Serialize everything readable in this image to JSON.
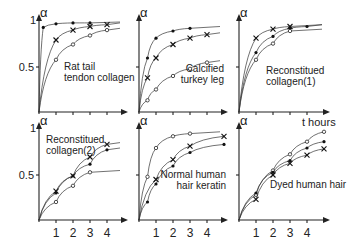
{
  "chart_data": [
    {
      "type": "line",
      "title": "Rat tail tendon collagen",
      "xlabel": "",
      "ylabel": "α",
      "ylim": [
        0,
        1
      ],
      "yticks": [
        "0.5",
        "1"
      ],
      "series": [
        {
          "name": "dot",
          "marker": "dot",
          "x": [
            0.25,
            1,
            2,
            3
          ],
          "y": [
            0.94,
            0.98,
            0.99,
            0.99
          ]
        },
        {
          "name": "cross",
          "marker": "x",
          "x": [
            1,
            2,
            3,
            4
          ],
          "y": [
            0.8,
            0.91,
            0.95,
            0.97
          ]
        },
        {
          "name": "circle",
          "marker": "circle",
          "x": [
            1,
            2,
            3,
            4
          ],
          "y": [
            0.58,
            0.75,
            0.85,
            0.91
          ]
        }
      ]
    },
    {
      "type": "line",
      "title": "Calcified turkey leg",
      "xlabel": "",
      "ylabel": "α",
      "ylim": [
        0,
        1
      ],
      "series": [
        {
          "name": "dot",
          "marker": "dot",
          "x": [
            0.5,
            1,
            2,
            3
          ],
          "y": [
            0.6,
            0.82,
            0.9,
            0.93
          ]
        },
        {
          "name": "cross",
          "marker": "x",
          "x": [
            0.5,
            1,
            2,
            3,
            4
          ],
          "y": [
            0.38,
            0.6,
            0.75,
            0.82,
            0.86
          ]
        },
        {
          "name": "circle",
          "marker": "circle",
          "x": [
            0.5,
            1,
            2,
            3,
            4
          ],
          "y": [
            0.13,
            0.25,
            0.4,
            0.48,
            0.55
          ]
        }
      ]
    },
    {
      "type": "line",
      "title": "Reconstitued collagen(1)",
      "xlabel": "t hours",
      "ylabel": "α",
      "ylim": [
        0,
        1
      ],
      "series": [
        {
          "name": "cross",
          "marker": "x",
          "x": [
            1,
            2,
            3
          ],
          "y": [
            0.82,
            0.92,
            0.95
          ]
        },
        {
          "name": "dot",
          "marker": "dot",
          "x": [
            1,
            2,
            3,
            4
          ],
          "y": [
            0.66,
            0.84,
            0.93,
            0.95
          ]
        },
        {
          "name": "circle",
          "marker": "circle",
          "x": [
            1,
            2,
            3
          ],
          "y": [
            0.58,
            0.76,
            0.9
          ]
        }
      ]
    },
    {
      "type": "line",
      "title": "Reconstitued collagen(2)",
      "xlabel": "",
      "ylabel": "α",
      "ylim": [
        0,
        1
      ],
      "yticks": [
        "0.5",
        "1"
      ],
      "xticks": [
        "1",
        "2",
        "3",
        "4"
      ],
      "series": [
        {
          "name": "cross",
          "marker": "x",
          "x": [
            1,
            2,
            3,
            4
          ],
          "y": [
            0.32,
            0.49,
            0.7,
            0.84
          ]
        },
        {
          "name": "dot",
          "marker": "dot",
          "x": [
            1,
            2,
            3,
            4
          ],
          "y": [
            0.3,
            0.49,
            0.62,
            0.78
          ]
        },
        {
          "name": "circle",
          "marker": "circle",
          "x": [
            1,
            2,
            3
          ],
          "y": [
            0.2,
            0.38,
            0.53
          ]
        }
      ]
    },
    {
      "type": "line",
      "title": "Normal human hair keratin",
      "xlabel": "",
      "ylabel": "α",
      "ylim": [
        0,
        1
      ],
      "xticks": [
        "1",
        "2",
        "3",
        "4"
      ],
      "series": [
        {
          "name": "circle",
          "marker": "circle",
          "x": [
            0.5,
            1,
            2,
            3
          ],
          "y": [
            0.48,
            0.8,
            0.93,
            0.96
          ]
        },
        {
          "name": "cross",
          "marker": "x",
          "x": [
            1,
            2,
            3,
            5
          ],
          "y": [
            0.45,
            0.67,
            0.82,
            0.93
          ]
        },
        {
          "name": "dot",
          "marker": "dot",
          "x": [
            0.5,
            1,
            2,
            3,
            5
          ],
          "y": [
            0.2,
            0.4,
            0.6,
            0.75,
            0.84
          ]
        }
      ]
    },
    {
      "type": "line",
      "title": "Dyed human hair",
      "xlabel": "",
      "ylabel": "α",
      "ylim": [
        0,
        1
      ],
      "xticks": [
        "1",
        "2",
        "3",
        "4"
      ],
      "series": [
        {
          "name": "circle",
          "marker": "circle",
          "x": [
            1,
            2,
            3,
            4,
            5
          ],
          "y": [
            0.28,
            0.55,
            0.73,
            0.87,
            0.98
          ]
        },
        {
          "name": "dot",
          "marker": "dot",
          "x": [
            1,
            2,
            3,
            4,
            5
          ],
          "y": [
            0.3,
            0.53,
            0.66,
            0.8,
            0.87
          ]
        },
        {
          "name": "cross",
          "marker": "x",
          "x": [
            1,
            2,
            3,
            4,
            5
          ],
          "y": [
            0.23,
            0.5,
            0.63,
            0.72,
            0.79
          ]
        }
      ]
    }
  ],
  "labels": {
    "alpha": "α",
    "one": "1",
    "half": "0.5",
    "t_hours": "t hours",
    "p1": [
      "Rat tail",
      "tendon collagen"
    ],
    "p2": [
      "Calcified",
      "turkey leg"
    ],
    "p3": [
      "Reconstitued",
      "collagen(1)"
    ],
    "p4": [
      "Reconstitued",
      "collagen(2)"
    ],
    "p5": [
      "Normal human",
      "hair keratin"
    ],
    "p6": [
      "Dyed human hair"
    ],
    "xt": [
      "1",
      "2",
      "3",
      "4"
    ]
  }
}
